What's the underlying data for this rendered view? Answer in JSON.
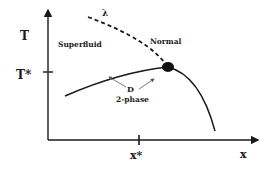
{
  "diagram": {
    "type": "phase-diagram",
    "axes": {
      "y_label": "T",
      "y_tick_label": "T*",
      "x_label": "x",
      "x_tick_label": "x*"
    },
    "regions": {
      "superfluid": "Superfluid",
      "normal": "Normal",
      "two_phase_letter": "D",
      "two_phase_label": "2-phase"
    },
    "lines": {
      "lambda_label": "λ"
    },
    "colors": {
      "ink": "#1a1a1a",
      "background": "#ffffff"
    }
  }
}
